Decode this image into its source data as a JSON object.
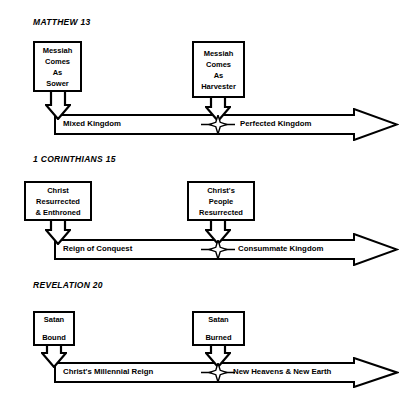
{
  "diagram": {
    "title_note": "Three parallel eschatological timelines",
    "sections": [
      {
        "heading": "MATTHEW 13",
        "left_box": {
          "lines": [
            "Messiah",
            "Comes",
            "As",
            "Sower"
          ]
        },
        "right_box": {
          "lines": [
            "Messiah",
            "Comes",
            "As",
            "Harvester"
          ]
        },
        "timeline": {
          "left_label": "Mixed Kingdom",
          "right_label": "Perfected Kingdom",
          "midpoint_marker": "four-point-star"
        }
      },
      {
        "heading": "1 CORINTHIANS 15",
        "left_box": {
          "lines": [
            "Christ",
            "Resurrected",
            "& Enthroned"
          ]
        },
        "right_box": {
          "lines": [
            "Christ's",
            "People",
            "Resurrected"
          ]
        },
        "timeline": {
          "left_label": "Reign of Conquest",
          "right_label": "Consummate Kingdom",
          "midpoint_marker": "four-point-star"
        }
      },
      {
        "heading": "REVELATION 20",
        "left_box": {
          "lines": [
            "Satan",
            "Bound"
          ]
        },
        "right_box": {
          "lines": [
            "Satan",
            "Burned"
          ]
        },
        "timeline": {
          "left_label": "Christ's Millennial Reign",
          "right_label": "New Heavens & New Earth",
          "midpoint_marker": "four-point-star"
        }
      }
    ],
    "colors": {
      "ink": "#000000",
      "paper": "#ffffff"
    }
  }
}
